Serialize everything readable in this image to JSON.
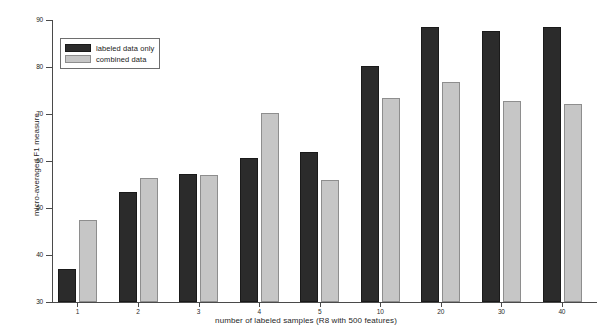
{
  "chart_data": {
    "type": "bar",
    "title": "",
    "subtitle": "",
    "xlabel": "number of labeled samples (R8 with 500 features)",
    "ylabel": "micro-averaged F1 measure",
    "categories": [
      "1",
      "2",
      "3",
      "4",
      "5",
      "10",
      "20",
      "30",
      "40"
    ],
    "series": [
      {
        "name": "labeled data only",
        "color": "#2b2b2b",
        "values": [
          37.0,
          53.4,
          57.2,
          60.6,
          62.0,
          80.3,
          88.5,
          87.6,
          88.5
        ]
      },
      {
        "name": "combined data",
        "color": "#c6c6c6",
        "values": [
          47.5,
          56.4,
          57.0,
          70.2,
          56.0,
          73.5,
          76.9,
          72.8,
          72.2
        ]
      }
    ],
    "ylim": [
      30,
      90
    ],
    "yticks": [
      30,
      40,
      50,
      60,
      70,
      80,
      90
    ],
    "ytick_labels": [
      "30",
      "40",
      "50",
      "60",
      "70",
      "80",
      "90"
    ],
    "xtick_labels": [
      "1",
      "2",
      "3",
      "4",
      "5",
      "10",
      "20",
      "30",
      "40"
    ],
    "grid": false,
    "legend_position": "upper-left",
    "legend_entries": [
      "labeled data only",
      "combined data"
    ]
  },
  "axis": {
    "line_color": "#4a4a4a",
    "background": "#ffffff"
  }
}
